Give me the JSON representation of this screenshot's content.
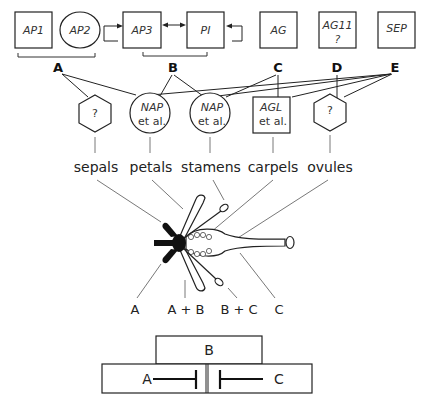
{
  "genes": [
    {
      "id": "ap1",
      "label": "AP1",
      "shape": "square",
      "sub": ""
    },
    {
      "id": "ap2",
      "label": "AP2",
      "shape": "ellipse",
      "sub": ""
    },
    {
      "id": "ap3",
      "label": "AP3",
      "shape": "square",
      "sub": ""
    },
    {
      "id": "pi",
      "label": "PI",
      "shape": "square",
      "sub": ""
    },
    {
      "id": "ag",
      "label": "AG",
      "shape": "square",
      "sub": ""
    },
    {
      "id": "ag11",
      "label": "AG11",
      "shape": "square",
      "sub": "?"
    },
    {
      "id": "sep",
      "label": "SEP",
      "shape": "square",
      "sub": ""
    }
  ],
  "groups": [
    {
      "id": "a",
      "label": "A"
    },
    {
      "id": "b",
      "label": "B"
    },
    {
      "id": "c",
      "label": "C"
    },
    {
      "id": "d",
      "label": "D"
    },
    {
      "id": "e",
      "label": "E"
    }
  ],
  "targets": [
    {
      "id": "t1",
      "shape": "hexagon",
      "line1": "?",
      "line2": ""
    },
    {
      "id": "t2",
      "shape": "circle",
      "line1": "NAP",
      "line2": "et al."
    },
    {
      "id": "t3",
      "shape": "circle",
      "line1": "NAP",
      "line2": "et al."
    },
    {
      "id": "t4",
      "shape": "square",
      "line1": "AGL",
      "line2": "et al."
    },
    {
      "id": "t5",
      "shape": "hexagon",
      "line1": "?",
      "line2": ""
    }
  ],
  "organs": [
    "sepals",
    "petals",
    "stamens",
    "carpels",
    "ovules"
  ],
  "whorls": [
    "A",
    "A + B",
    "B + C",
    "C"
  ],
  "abc_model": {
    "top": "B",
    "left": "A",
    "right": "C"
  }
}
